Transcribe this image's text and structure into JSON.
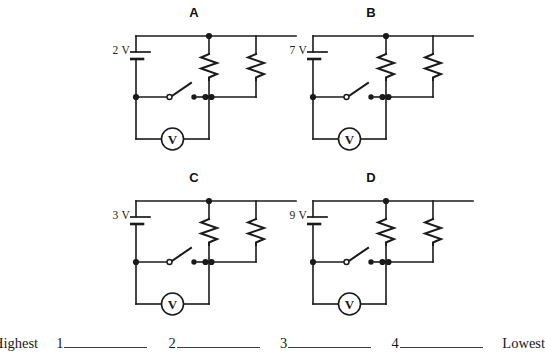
{
  "page": {
    "background_color": "#ffffff",
    "line_color": "#1a1a1a"
  },
  "circuits": [
    {
      "id": "circuit-a",
      "label": "A",
      "battery_voltage": "2 V",
      "meter_symbol": "V",
      "components": {
        "battery": "single-cell-battery",
        "resistor_left": "resistor-zigzag",
        "resistor_right": "resistor-zigzag",
        "switch": "open-knife-switch",
        "meter": "voltmeter"
      }
    },
    {
      "id": "circuit-b",
      "label": "B",
      "battery_voltage": "7 V",
      "meter_symbol": "V",
      "components": {
        "battery": "single-cell-battery",
        "resistor_left": "resistor-zigzag",
        "resistor_right": "resistor-zigzag",
        "switch": "open-knife-switch",
        "meter": "voltmeter"
      }
    },
    {
      "id": "circuit-c",
      "label": "C",
      "battery_voltage": "3 V",
      "meter_symbol": "V",
      "components": {
        "battery": "single-cell-battery",
        "resistor_left": "resistor-zigzag",
        "resistor_right": "resistor-zigzag",
        "switch": "open-knife-switch",
        "meter": "voltmeter"
      }
    },
    {
      "id": "circuit-d",
      "label": "D",
      "battery_voltage": "9 V",
      "meter_symbol": "V",
      "components": {
        "battery": "single-cell-battery",
        "resistor_left": "resistor-zigzag",
        "resistor_right": "resistor-zigzag",
        "switch": "open-knife-switch",
        "meter": "voltmeter"
      }
    }
  ],
  "ranking": {
    "highest_label": "Highest",
    "lowest_label": "Lowest",
    "slots": [
      {
        "number": "1",
        "answer": ""
      },
      {
        "number": "2",
        "answer": ""
      },
      {
        "number": "3",
        "answer": ""
      },
      {
        "number": "4",
        "answer": ""
      }
    ]
  }
}
